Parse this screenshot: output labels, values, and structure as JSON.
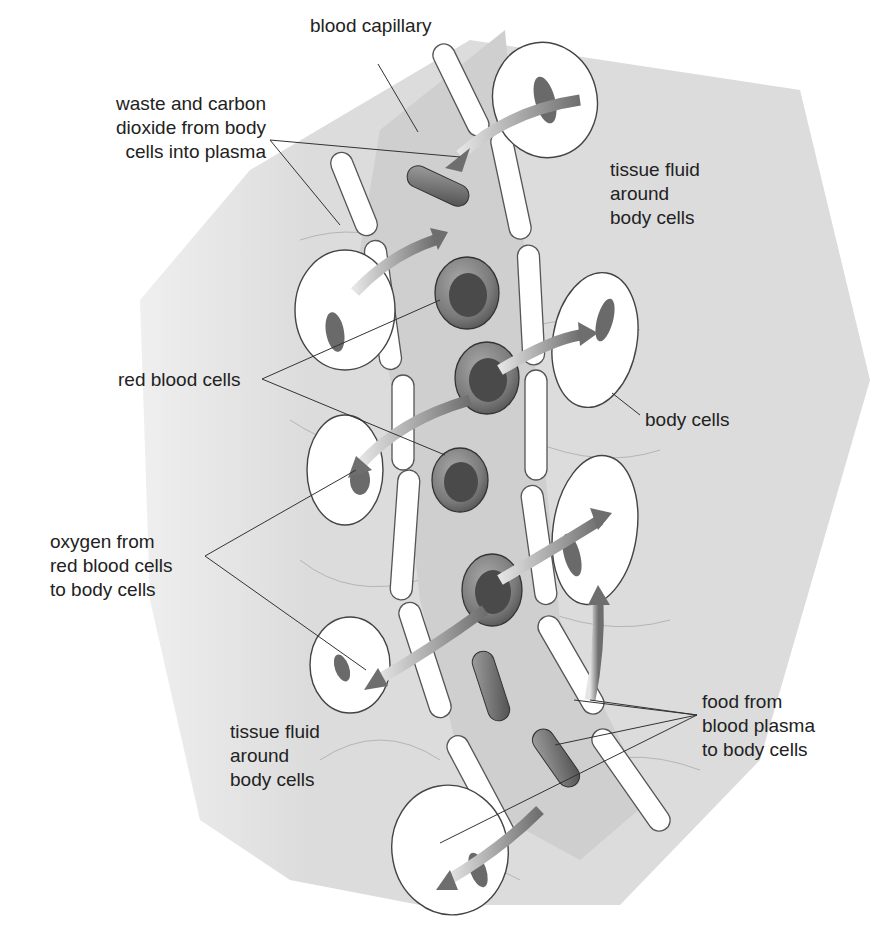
{
  "colors": {
    "background": "#ffffff",
    "tissue_fluid": "#d9d9d9",
    "plasma": "#cfcfcf",
    "capillary_wall": "#ffffff",
    "outline": "#444444",
    "rbc_outer": "#7a7a7a",
    "rbc_inner": "#4a4a4a",
    "nucleus": "#6a6a6a",
    "arrow": "#7d7d7d",
    "leader_line": "#333333",
    "text": "#222222"
  },
  "labels": {
    "blood_capillary": {
      "lines": [
        "blood capillary"
      ]
    },
    "waste": {
      "lines": [
        "waste and carbon",
        "dioxide from body",
        "cells into plasma"
      ]
    },
    "tissue_fluid_top": {
      "lines": [
        "tissue fluid",
        "around",
        "body cells"
      ]
    },
    "red_blood_cells": {
      "lines": [
        "red blood cells"
      ]
    },
    "body_cells": {
      "lines": [
        "body cells"
      ]
    },
    "oxygen": {
      "lines": [
        "oxygen from",
        "red blood cells",
        "to body cells"
      ]
    },
    "tissue_fluid_bottom": {
      "lines": [
        "tissue fluid",
        "around",
        "body cells"
      ]
    },
    "food": {
      "lines": [
        "food from",
        "blood plasma",
        "to body cells"
      ]
    }
  }
}
